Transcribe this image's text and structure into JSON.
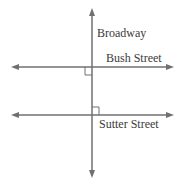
{
  "diagram": {
    "streets": [
      {
        "name": "Broadway",
        "orientation": "vertical"
      },
      {
        "name": "Bush Street",
        "orientation": "horizontal"
      },
      {
        "name": "Sutter Street",
        "orientation": "horizontal"
      }
    ],
    "labels": {
      "broadway": "Broadway",
      "bush": "Bush Street",
      "sutter": "Sutter Street"
    },
    "right_angle_markers": 2,
    "line_color": "#707070"
  }
}
